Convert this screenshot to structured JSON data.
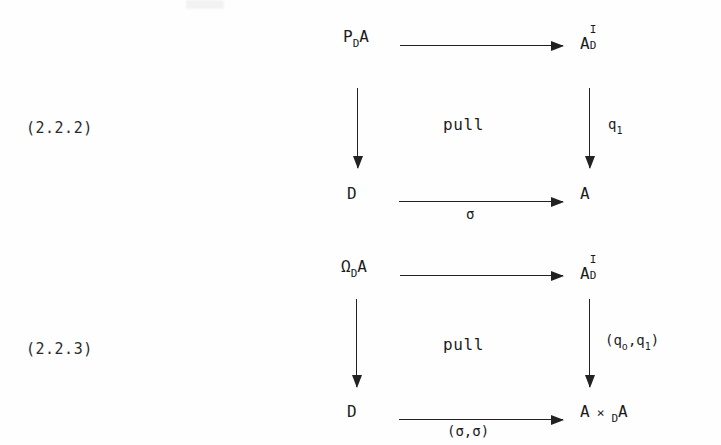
{
  "page": {
    "background_color": "#fefefe",
    "ink_color": "#1c1c1c",
    "kind": "scanned-mathematics-page",
    "content_description": "Two labelled commutative square (pullback) diagrams"
  },
  "diagrams": [
    {
      "number": "(2.2.2)",
      "center_label": "pull",
      "nodes": {
        "top_left": {
          "base": "P",
          "sub": "D",
          "tail": "A",
          "text": "P_D A"
        },
        "top_right": {
          "base": "A",
          "sup": "I",
          "sub": "D",
          "text": "A_D^I"
        },
        "bottom_left": {
          "base": "D",
          "text": "D"
        },
        "bottom_right": {
          "base": "A",
          "text": "A"
        }
      },
      "arrows": {
        "top": {
          "direction": "right",
          "label": ""
        },
        "left": {
          "direction": "down",
          "label": ""
        },
        "right": {
          "direction": "down",
          "label": "q",
          "label_sub": "1",
          "label_text": "q1"
        },
        "bottom": {
          "direction": "right",
          "label": "σ",
          "label_text": "σ"
        }
      }
    },
    {
      "number": "(2.2.3)",
      "center_label": "pull",
      "nodes": {
        "top_left": {
          "base": "Ω",
          "sub": "D",
          "tail": "A",
          "text": "Ω_D A"
        },
        "top_right": {
          "base": "A",
          "sup": "I",
          "sub": "D",
          "text": "A_D^I"
        },
        "bottom_left": {
          "base": "D",
          "text": "D"
        },
        "bottom_right": {
          "base": "A",
          "times": "×",
          "sub": "D",
          "tail": "A",
          "text": "A ×_D A"
        }
      },
      "arrows": {
        "top": {
          "direction": "right",
          "label": ""
        },
        "left": {
          "direction": "down",
          "label": ""
        },
        "right": {
          "direction": "down",
          "label": "(q",
          "label_sub_o": "o",
          "label_mid": ",q",
          "label_sub_1": "1",
          "label_close": ")",
          "label_text": "(q_o,q_1)"
        },
        "bottom": {
          "direction": "right",
          "label": "(σ,σ)",
          "label_text": "(σ,σ)"
        }
      }
    }
  ]
}
